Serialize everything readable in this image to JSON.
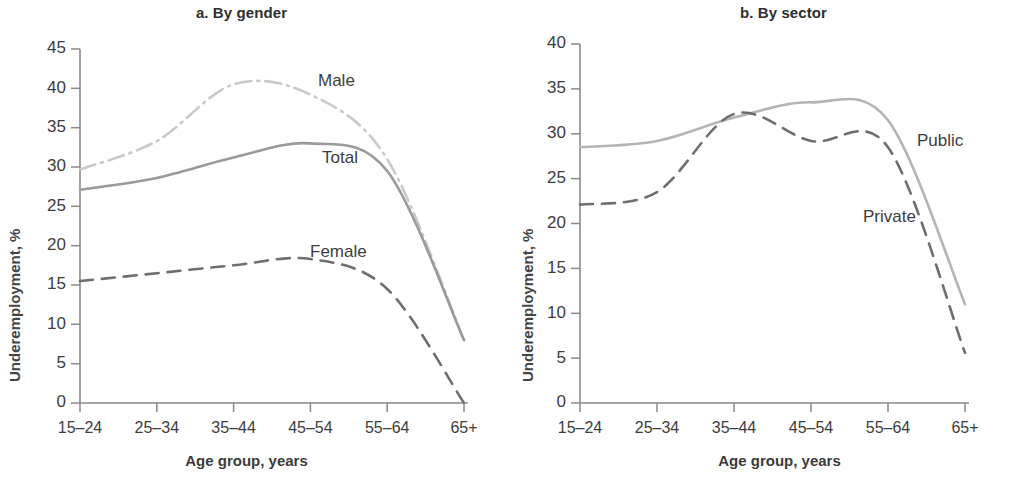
{
  "chart_data": [
    {
      "type": "line",
      "title": "a. By gender",
      "xlabel": "Age group, years",
      "ylabel": "Underemployment, %",
      "categories": [
        "15–24",
        "25–34",
        "35–44",
        "45–54",
        "55–64",
        "65+"
      ],
      "ylim": [
        0,
        45
      ],
      "yticks": [
        0,
        5,
        10,
        15,
        20,
        25,
        30,
        35,
        40,
        45
      ],
      "grid": false,
      "legend_position": "inline-annotation",
      "series": [
        {
          "name": "Male",
          "values": [
            29.7,
            33.3,
            40.5,
            39.2,
            31.0,
            8.0
          ],
          "style": "dash-dot",
          "color": "#c9c9c9"
        },
        {
          "name": "Total",
          "values": [
            27.1,
            28.6,
            31.2,
            33.0,
            29.5,
            8.0
          ],
          "style": "solid",
          "color": "#9a9a9a"
        },
        {
          "name": "Female",
          "values": [
            15.5,
            16.5,
            17.5,
            18.3,
            14.5,
            0.0
          ],
          "style": "dashed",
          "color": "#6e6e6e"
        }
      ],
      "annotations": [
        {
          "text": "Male",
          "x": 4.05,
          "y": 40.6
        },
        {
          "text": "Total",
          "x": 4.05,
          "y": 31.0
        },
        {
          "text": "Female",
          "x": 4.02,
          "y": 19.8
        }
      ]
    },
    {
      "type": "line",
      "title": "b. By sector",
      "xlabel": "Age group, years",
      "ylabel": "Underemployment, %",
      "categories": [
        "15–24",
        "25–34",
        "35–44",
        "45–54",
        "55–64",
        "65+"
      ],
      "ylim": [
        0,
        40
      ],
      "yticks": [
        0,
        5,
        10,
        15,
        20,
        25,
        30,
        35,
        40
      ],
      "grid": false,
      "legend_position": "inline-annotation",
      "series": [
        {
          "name": "Public",
          "values": [
            28.5,
            29.2,
            31.8,
            33.5,
            31.5,
            11.0
          ],
          "style": "solid",
          "color": "#b4b4b4"
        },
        {
          "name": "Private",
          "values": [
            22.1,
            23.5,
            32.2,
            29.2,
            28.5,
            5.6
          ],
          "style": "dashed",
          "color": "#6e6e6e"
        }
      ],
      "annotations": [
        {
          "text": "Public",
          "x": 4.55,
          "y": 30.0
        },
        {
          "text": "Private",
          "x": 4.12,
          "y": 21.6
        }
      ]
    }
  ],
  "panels": {
    "a": {
      "title": "a. By gender",
      "xlabel": "Age group, years",
      "ylabel": "Underemployment, %",
      "yticks": [
        "45",
        "40",
        "35",
        "30",
        "25",
        "20",
        "15",
        "10",
        "5",
        "0"
      ],
      "xticks": [
        "15–24",
        "25–34",
        "35–44",
        "45–54",
        "55–64",
        "65+"
      ],
      "labels": {
        "male": "Male",
        "total": "Total",
        "female": "Female"
      }
    },
    "b": {
      "title": "b. By sector",
      "xlabel": "Age group, years",
      "ylabel": "Underemployment, %",
      "yticks": [
        "40",
        "35",
        "30",
        "25",
        "20",
        "15",
        "10",
        "5",
        "0"
      ],
      "xticks": [
        "15–24",
        "25–34",
        "35–44",
        "45–54",
        "55–64",
        "65+"
      ],
      "labels": {
        "public": "Public",
        "private": "Private"
      }
    }
  },
  "colors": {
    "axis": "#8a8a8a",
    "text": "#3d3d3d",
    "title": "#2e2e2e",
    "male": "#c9c9c9",
    "total": "#9a9a9a",
    "female": "#6e6e6e",
    "public": "#b4b4b4",
    "private": "#6e6e6e",
    "background": "#ffffff"
  }
}
